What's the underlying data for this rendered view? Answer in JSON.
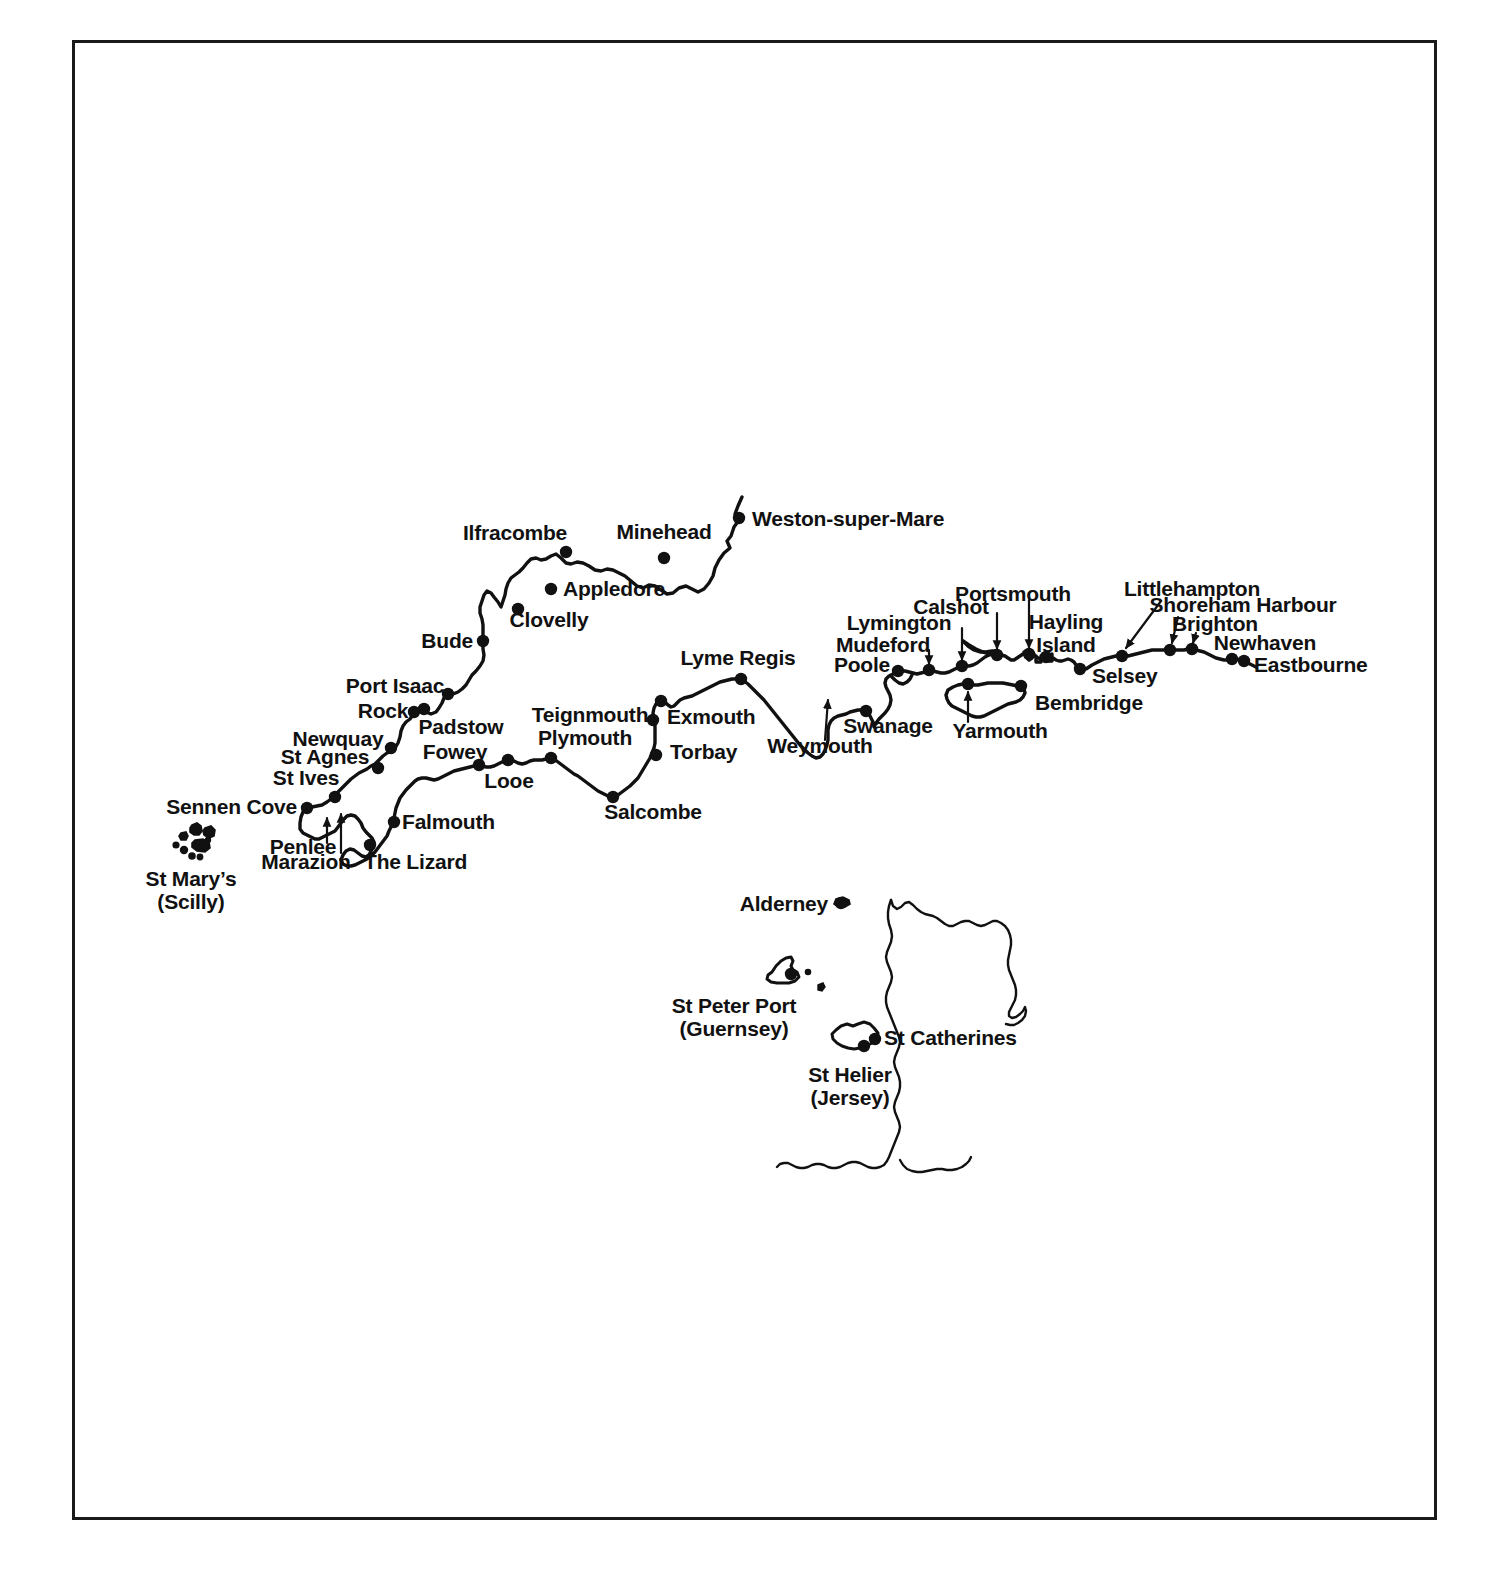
{
  "map": {
    "title": "South West England, South Coast and Channel Islands coastal map",
    "background_color": "#ffffff",
    "ink_color": "#111111",
    "border_color": "#1a1a1a",
    "frame": {
      "x": 72,
      "y": 40,
      "width": 1365,
      "height": 1480
    },
    "places": [
      {
        "name": "Weston-super-Mare",
        "label": "Weston-super-Mare",
        "lx": 752,
        "ly": 519,
        "anchor": "left",
        "dot": {
          "x": 739,
          "y": 518
        }
      },
      {
        "name": "Minehead",
        "label": "Minehead",
        "lx": 664,
        "ly": 532,
        "anchor": "center",
        "dot": {
          "x": 664,
          "y": 558
        }
      },
      {
        "name": "Ilfracombe",
        "label": "Ilfracombe",
        "lx": 515,
        "ly": 533,
        "anchor": "center",
        "dot": {
          "x": 566,
          "y": 552
        }
      },
      {
        "name": "Appledore",
        "label": "Appledore",
        "lx": 563,
        "ly": 589,
        "anchor": "left",
        "dot": {
          "x": 551,
          "y": 589
        }
      },
      {
        "name": "Clovelly",
        "label": "Clovelly",
        "lx": 549,
        "ly": 620,
        "anchor": "center",
        "dot": {
          "x": 518,
          "y": 609
        }
      },
      {
        "name": "Bude",
        "label": "Bude",
        "lx": 473,
        "ly": 641,
        "anchor": "right",
        "dot": {
          "x": 483,
          "y": 641
        }
      },
      {
        "name": "Port Isaac",
        "label": "Port Isaac",
        "lx": 395,
        "ly": 686,
        "anchor": "center",
        "dot": {
          "x": 448,
          "y": 694
        }
      },
      {
        "name": "Rock",
        "label": "Rock",
        "lx": 383,
        "ly": 711,
        "anchor": "center",
        "dot": {
          "x": 414,
          "y": 712
        }
      },
      {
        "name": "Padstow",
        "label": "Padstow",
        "lx": 461,
        "ly": 727,
        "anchor": "center",
        "dot": {
          "x": 424,
          "y": 709
        }
      },
      {
        "name": "Newquay",
        "label": "Newquay",
        "lx": 338,
        "ly": 739,
        "anchor": "center",
        "dot": {
          "x": 391,
          "y": 748
        }
      },
      {
        "name": "St Agnes",
        "label": "St Agnes",
        "lx": 325,
        "ly": 757,
        "anchor": "center",
        "dot": {
          "x": 378,
          "y": 768
        }
      },
      {
        "name": "St Ives",
        "label": "St Ives",
        "lx": 306,
        "ly": 778,
        "anchor": "center",
        "dot": {
          "x": 335,
          "y": 797
        }
      },
      {
        "name": "Sennen Cove",
        "label": "Sennen Cove",
        "lx": 297,
        "ly": 807,
        "anchor": "right",
        "dot": {
          "x": 307,
          "y": 808
        }
      },
      {
        "name": "Penlee",
        "label": "Penlee",
        "lx": 303,
        "ly": 847,
        "anchor": "center",
        "dot": null,
        "arrow": {
          "x1": 327,
          "y1": 843,
          "x2": 327,
          "y2": 818
        }
      },
      {
        "name": "Marazion",
        "label": "Marazion",
        "lx": 306,
        "ly": 862,
        "anchor": "center",
        "dot": null,
        "arrow": {
          "x1": 341,
          "y1": 853,
          "x2": 341,
          "y2": 814
        }
      },
      {
        "name": "The Lizard",
        "label": "The Lizard",
        "lx": 364,
        "ly": 862,
        "anchor": "left",
        "dot": {
          "x": 370,
          "y": 845
        }
      },
      {
        "name": "Falmouth",
        "label": "Falmouth",
        "lx": 402,
        "ly": 822,
        "anchor": "left",
        "dot": {
          "x": 394,
          "y": 822
        }
      },
      {
        "name": "Fowey",
        "label": "Fowey",
        "lx": 455,
        "ly": 752,
        "anchor": "center",
        "dot": {
          "x": 479,
          "y": 765
        }
      },
      {
        "name": "Looe",
        "label": "Looe",
        "lx": 509,
        "ly": 781,
        "anchor": "center",
        "dot": {
          "x": 508,
          "y": 760
        }
      },
      {
        "name": "Plymouth",
        "label": "Plymouth",
        "lx": 585,
        "ly": 738,
        "anchor": "center",
        "dot": {
          "x": 551,
          "y": 758
        }
      },
      {
        "name": "Teignmouth",
        "label": "Teignmouth",
        "lx": 590,
        "ly": 715,
        "anchor": "center",
        "dot": {
          "x": 653,
          "y": 720
        }
      },
      {
        "name": "Exmouth",
        "label": "Exmouth",
        "lx": 667,
        "ly": 717,
        "anchor": "left",
        "dot": {
          "x": 661,
          "y": 701
        }
      },
      {
        "name": "Torbay",
        "label": "Torbay",
        "lx": 670,
        "ly": 752,
        "anchor": "left",
        "dot": {
          "x": 656,
          "y": 755
        }
      },
      {
        "name": "Salcombe",
        "label": "Salcombe",
        "lx": 653,
        "ly": 812,
        "anchor": "center",
        "dot": {
          "x": 613,
          "y": 797
        }
      },
      {
        "name": "Lyme Regis",
        "label": "Lyme Regis",
        "lx": 738,
        "ly": 658,
        "anchor": "center",
        "dot": {
          "x": 741,
          "y": 679
        }
      },
      {
        "name": "Weymouth",
        "label": "Weymouth",
        "lx": 820,
        "ly": 746,
        "anchor": "center",
        "dot": null,
        "arrow": {
          "x1": 825,
          "y1": 740,
          "x2": 828,
          "y2": 700
        }
      },
      {
        "name": "Swanage",
        "label": "Swanage",
        "lx": 888,
        "ly": 726,
        "anchor": "center",
        "dot": {
          "x": 866,
          "y": 711
        }
      },
      {
        "name": "Poole",
        "label": "Poole",
        "lx": 862,
        "ly": 665,
        "anchor": "center",
        "dot": {
          "x": 898,
          "y": 671
        }
      },
      {
        "name": "Mudeford",
        "label": "Mudeford",
        "lx": 883,
        "ly": 645,
        "anchor": "center",
        "dot": {
          "x": 929,
          "y": 670
        },
        "arrow": {
          "x1": 929,
          "y1": 650,
          "x2": 929,
          "y2": 664
        }
      },
      {
        "name": "Lymington",
        "label": "Lymington",
        "lx": 899,
        "ly": 623,
        "anchor": "center",
        "dot": {
          "x": 962,
          "y": 666
        },
        "arrow": {
          "x1": 962,
          "y1": 628,
          "x2": 962,
          "y2": 660
        }
      },
      {
        "name": "Calshot",
        "label": "Calshot",
        "lx": 951,
        "ly": 607,
        "anchor": "center",
        "dot": {
          "x": 997,
          "y": 655
        },
        "arrow": {
          "x1": 997,
          "y1": 613,
          "x2": 997,
          "y2": 649
        }
      },
      {
        "name": "Portsmouth",
        "label": "Portsmouth",
        "lx": 1013,
        "ly": 594,
        "anchor": "center",
        "dot": {
          "x": 1029,
          "y": 654
        },
        "arrow": {
          "x1": 1029,
          "y1": 600,
          "x2": 1029,
          "y2": 648
        }
      },
      {
        "name": "Hayling Island",
        "label": "Hayling\nIsland",
        "lx": 1066,
        "ly": 621,
        "anchor": "center",
        "dot": {
          "x": 1046,
          "y": 657
        }
      },
      {
        "name": "Selsey",
        "label": "Selsey",
        "lx": 1092,
        "ly": 676,
        "anchor": "left",
        "dot": {
          "x": 1080,
          "y": 669
        }
      },
      {
        "name": "Littlehampton",
        "label": "Littlehampton",
        "lx": 1192,
        "ly": 589,
        "anchor": "center",
        "dot": {
          "x": 1122,
          "y": 656
        },
        "arrow": {
          "x1": 1161,
          "y1": 601,
          "x2": 1126,
          "y2": 648
        }
      },
      {
        "name": "Shoreham Harbour",
        "label": "Shoreham Harbour",
        "lx": 1243,
        "ly": 605,
        "anchor": "center",
        "dot": {
          "x": 1170,
          "y": 650
        },
        "arrow": {
          "x1": 1178,
          "y1": 617,
          "x2": 1172,
          "y2": 643
        }
      },
      {
        "name": "Brighton",
        "label": "Brighton",
        "lx": 1215,
        "ly": 624,
        "anchor": "center",
        "dot": {
          "x": 1192,
          "y": 649
        },
        "arrow": {
          "x1": 1196,
          "y1": 633,
          "x2": 1193,
          "y2": 643
        }
      },
      {
        "name": "Newhaven",
        "label": "Newhaven",
        "lx": 1265,
        "ly": 643,
        "anchor": "center",
        "dot": {
          "x": 1232,
          "y": 659
        }
      },
      {
        "name": "Eastbourne",
        "label": "Eastbourne",
        "lx": 1254,
        "ly": 665,
        "anchor": "left",
        "dot": {
          "x": 1244,
          "y": 661
        }
      },
      {
        "name": "Bembridge",
        "label": "Bembridge",
        "lx": 1035,
        "ly": 703,
        "anchor": "left",
        "dot": {
          "x": 1021,
          "y": 686
        }
      },
      {
        "name": "Yarmouth",
        "label": "Yarmouth",
        "lx": 1000,
        "ly": 731,
        "anchor": "center",
        "dot": {
          "x": 968,
          "y": 684
        },
        "arrow": {
          "x1": 968,
          "y1": 722,
          "x2": 968,
          "y2": 692
        }
      },
      {
        "name": "St Mary's (Scilly)",
        "label": "St Mary’s\n(Scilly)",
        "lx": 191,
        "ly": 878,
        "anchor": "center",
        "dot": null
      },
      {
        "name": "Alderney",
        "label": "Alderney",
        "lx": 828,
        "ly": 904,
        "anchor": "right",
        "dot": {
          "x": 841,
          "y": 903
        }
      },
      {
        "name": "St Peter Port (Guernsey)",
        "label": "St Peter Port\n(Guernsey)",
        "lx": 734,
        "ly": 1005,
        "anchor": "center",
        "dot": {
          "x": 791,
          "y": 974
        }
      },
      {
        "name": "St Helier (Jersey)",
        "label": "St Helier\n(Jersey)",
        "lx": 850,
        "ly": 1074,
        "anchor": "center",
        "dot": {
          "x": 864,
          "y": 1046
        }
      },
      {
        "name": "St Catherines",
        "label": "St Catherines",
        "lx": 884,
        "ly": 1038,
        "anchor": "left",
        "dot": {
          "x": 875,
          "y": 1039
        }
      }
    ],
    "features": [
      {
        "name": "mainland-south-coast",
        "type": "coastline"
      },
      {
        "name": "isle-of-wight",
        "type": "island"
      },
      {
        "name": "isles-of-scilly",
        "type": "island-group"
      },
      {
        "name": "alderney",
        "type": "island"
      },
      {
        "name": "guernsey",
        "type": "island"
      },
      {
        "name": "jersey",
        "type": "island"
      },
      {
        "name": "normandy-brittany-coast",
        "type": "coastline"
      }
    ]
  }
}
